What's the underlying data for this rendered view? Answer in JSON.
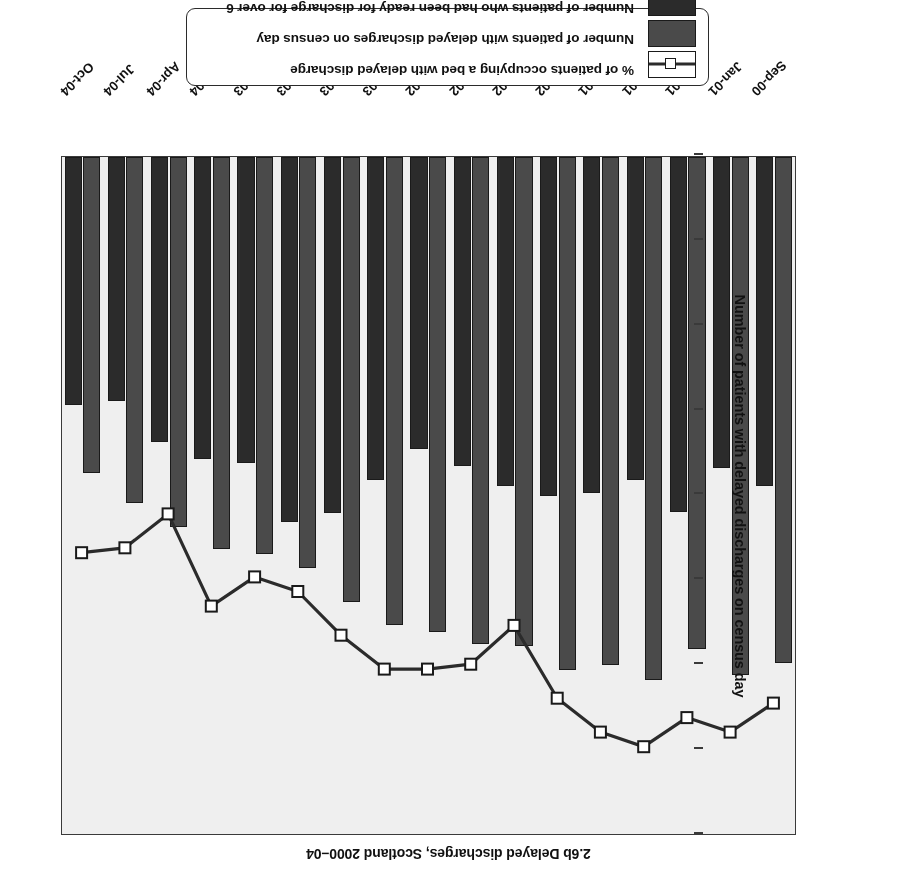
{
  "figure": {
    "title": "2.6b  Delayed discharges, Scotland 2000–04",
    "orientation_note": "page-upside-down"
  },
  "legend": {
    "items": [
      {
        "label": "% of patients occupying a bed with delayed discharge",
        "marker": "line-marker",
        "color": "#2b2b2b"
      },
      {
        "label": "Number of patients with delayed discharges on census day",
        "marker": "gray-swatch",
        "color": "#4a4a4a"
      },
      {
        "label": "Number of patients who had been ready for discharge for over 6 weeks at census",
        "marker": "dark-swatch",
        "color": "#2b2b2b"
      }
    ]
  },
  "axes": {
    "left": {
      "title": "Number of patients with delayed discharges on census day",
      "ticks": [
        "0",
        "500",
        "1000",
        "1500",
        "2000",
        "2500",
        "3000",
        "3500",
        "4000"
      ],
      "min": 0,
      "max": 4000
    },
    "right": {
      "title": "% of patients occupying a bed with delayed discharge",
      "ticks": [
        "0",
        "2",
        "4",
        "6",
        "8",
        "10",
        "12",
        "14"
      ],
      "min": 0,
      "max": 14
    }
  },
  "chart_data": {
    "type": "bar",
    "title": "2.6b  Delayed discharges, Scotland 2000–04",
    "xlabel": "",
    "ylabel": "Number of patients with delayed discharges on census day",
    "y2label": "% of patients occupying a bed with delayed discharge",
    "ylim": [
      0,
      4000
    ],
    "y2lim": [
      0,
      14
    ],
    "grid": false,
    "legend_position": "bottom",
    "categories": [
      "Sep-00",
      "Jan-01",
      "Apr-01",
      "Jul-01",
      "Oct-01",
      "Jan-02",
      "Apr-02",
      "Jul-02",
      "Oct-02",
      "Jan-03",
      "Apr-03",
      "Jul-03",
      "Oct-03",
      "Jan-04",
      "Apr-04",
      "Jul-04",
      "Oct-04"
    ],
    "series": [
      {
        "name": "Number of patients with delayed discharges on census day",
        "axis": "left",
        "kind": "bar",
        "color": "#4a4a4a",
        "values": [
          2980,
          3050,
          2900,
          3080,
          2990,
          3020,
          2880,
          2870,
          2800,
          2760,
          2620,
          2420,
          2340,
          2310,
          2180,
          2040,
          1860
        ]
      },
      {
        "name": "Number of patients who had been ready for discharge for over 6 weeks at census",
        "axis": "left",
        "kind": "bar",
        "color": "#2b2b2b",
        "values": [
          1940,
          1830,
          2090,
          1900,
          1980,
          2000,
          1940,
          1820,
          1720,
          1900,
          2100,
          2150,
          1800,
          1780,
          1680,
          1440,
          1460
        ]
      },
      {
        "name": "% of patients occupying a bed with delayed discharge",
        "axis": "right",
        "kind": "line",
        "color": "#2b2b2b",
        "marker": "open-square",
        "values": [
          11.3,
          11.9,
          11.6,
          12.2,
          11.9,
          11.2,
          9.7,
          10.5,
          10.6,
          10.6,
          9.9,
          9.0,
          8.7,
          9.3,
          7.4,
          8.1,
          8.2
        ]
      }
    ]
  }
}
